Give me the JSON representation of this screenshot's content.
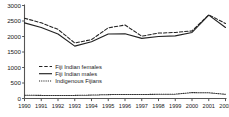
{
  "chart_data": {
    "type": "line",
    "title": "",
    "xlabel": "",
    "ylabel": "",
    "x": [
      1990,
      1991,
      1992,
      1993,
      1994,
      1995,
      1996,
      1997,
      1998,
      1999,
      2000,
      2001,
      2002
    ],
    "categories": [
      "1990",
      "1991",
      "1992",
      "1993",
      "1994",
      "1995",
      "1996",
      "1997",
      "1998",
      "1999",
      "2000",
      "2001",
      "2002"
    ],
    "xlim": [
      1990,
      2002
    ],
    "ylim": [
      0,
      3000
    ],
    "yticks": [
      0,
      500,
      1000,
      1500,
      2000,
      2500,
      3000
    ],
    "ytick_labels": [
      "0",
      "500",
      "1000",
      "1500",
      "2000",
      "2500",
      "3000"
    ],
    "grid": false,
    "legend_position": "center-left",
    "series": [
      {
        "name": "Fiji Indian females",
        "style": "dashed",
        "color": "#222222",
        "values": [
          2590,
          2440,
          2230,
          1790,
          1900,
          2280,
          2370,
          2010,
          2110,
          2130,
          2180,
          2700,
          2420
        ]
      },
      {
        "name": "Fiji Indian males",
        "style": "solid",
        "color": "#222222",
        "values": [
          2440,
          2290,
          2080,
          1690,
          1830,
          2080,
          2090,
          1940,
          2000,
          2020,
          2130,
          2690,
          2290
        ]
      },
      {
        "name": "Indigenous Fijians",
        "style": "dotted",
        "color": "#333333",
        "values": [
          105,
          100,
          100,
          100,
          110,
          125,
          130,
          130,
          135,
          140,
          190,
          185,
          135
        ]
      }
    ]
  },
  "legend": {
    "items": [
      {
        "label": "Fiji Indian females",
        "style": "dashed"
      },
      {
        "label": "Fiji Indian males",
        "style": "solid"
      },
      {
        "label": "Indigenous Fijians",
        "style": "dotted"
      }
    ]
  }
}
